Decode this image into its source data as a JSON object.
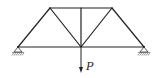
{
  "diagram": {
    "type": "truss",
    "nodes": {
      "A": [
        18,
        47
      ],
      "C": [
        50,
        8
      ],
      "D": [
        81,
        8
      ],
      "E": [
        112,
        8
      ],
      "M": [
        81,
        47
      ],
      "B": [
        144,
        47
      ]
    },
    "members": [
      [
        "A",
        "B"
      ],
      [
        "C",
        "E"
      ],
      [
        "A",
        "C"
      ],
      [
        "C",
        "M"
      ],
      [
        "D",
        "M"
      ],
      [
        "M",
        "E"
      ],
      [
        "E",
        "B"
      ]
    ],
    "supports": [
      {
        "node": "A",
        "type": "pin"
      },
      {
        "node": "B",
        "type": "pin"
      }
    ],
    "load": {
      "node": "M",
      "label": "P",
      "direction": "down",
      "start": [
        81,
        48
      ],
      "end": [
        81,
        73
      ]
    },
    "colors": {
      "line": "#222222",
      "background": "#ffffff"
    }
  }
}
